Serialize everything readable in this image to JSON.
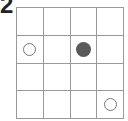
{
  "label": "2",
  "grid": {
    "rows": 4,
    "cols": 4,
    "cells": [
      [
        "",
        "",
        "",
        ""
      ],
      [
        "open",
        "",
        "filled",
        ""
      ],
      [
        "",
        "",
        "",
        ""
      ],
      [
        "",
        "",
        "",
        "open"
      ]
    ]
  },
  "colors": {
    "line": "#9a9a9a",
    "filled": "#5a5a5a",
    "open_stroke": "#777777"
  }
}
